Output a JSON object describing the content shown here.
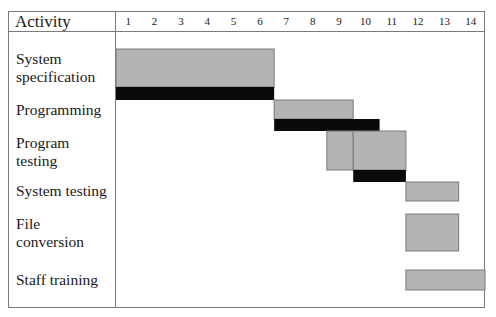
{
  "chart_data": {
    "type": "gantt",
    "title": "",
    "header_label": "Activity",
    "x_ticks": [
      "1",
      "2",
      "3",
      "4",
      "5",
      "6",
      "7",
      "8",
      "9",
      "10",
      "11",
      "12",
      "13",
      "14"
    ],
    "xlim": [
      1,
      14
    ],
    "unit": "week",
    "legend": "none",
    "grid": false,
    "colors": {
      "planned": "#b4b4b4",
      "actual": "#0a0a0a",
      "border": "#7a7a7a"
    },
    "activities": [
      {
        "name": "System\nspecification",
        "label_lines": [
          "System",
          "specification"
        ],
        "planned": [
          {
            "start": 1,
            "end": 6
          }
        ],
        "actual": [
          {
            "start": 1,
            "end": 6
          }
        ]
      },
      {
        "name": "Programming",
        "label_lines": [
          "Programming"
        ],
        "planned": [
          {
            "start": 7,
            "end": 9
          }
        ],
        "actual": [
          {
            "start": 7,
            "end": 10
          }
        ]
      },
      {
        "name": "Program\ntesting",
        "label_lines": [
          "Program",
          "testing"
        ],
        "planned": [
          {
            "start": 9,
            "end": 9
          },
          {
            "start": 10,
            "end": 11
          }
        ],
        "actual": [
          {
            "start": 10,
            "end": 11
          }
        ]
      },
      {
        "name": "System testing",
        "label_lines": [
          "System testing"
        ],
        "planned": [
          {
            "start": 12,
            "end": 13
          }
        ],
        "actual": []
      },
      {
        "name": "File\nconversion",
        "label_lines": [
          "File",
          "conversion"
        ],
        "planned": [
          {
            "start": 12,
            "end": 13
          }
        ],
        "actual": []
      },
      {
        "name": "Staff training",
        "label_lines": [
          "Staff training"
        ],
        "planned": [
          {
            "start": 12,
            "end": 14
          }
        ],
        "actual": []
      }
    ]
  }
}
